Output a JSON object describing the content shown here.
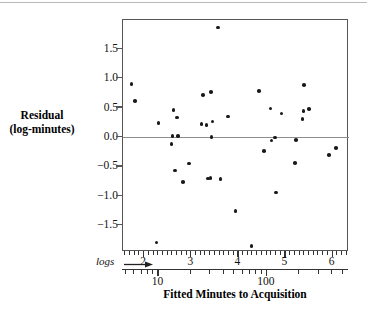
{
  "chart_data": {
    "type": "scatter",
    "title": "",
    "xlabel": "Fitted Minutes to Acquisition",
    "ylabel": "Residual (log-minutes)",
    "ylabel_line1": "Residual",
    "ylabel_line2": "(log-minutes)",
    "xlabel_secondary": "logs",
    "x_scale": "log",
    "x_is_log_of_minutes": true,
    "xlim": [
      1.55,
      6.35
    ],
    "ylim": [
      -1.95,
      2.0
    ],
    "grid": false,
    "legend": null,
    "zero_reference_line": 0.0,
    "y_ticks": [
      {
        "value": 1.5,
        "label": "1.5"
      },
      {
        "value": 1.0,
        "label": "1.0"
      },
      {
        "value": 0.5,
        "label": "0.5"
      },
      {
        "value": 0.0,
        "label": "0.0"
      },
      {
        "value": -0.5,
        "label": "−0.5"
      },
      {
        "value": -1.0,
        "label": "−1.0"
      },
      {
        "value": -1.5,
        "label": "−1.5"
      }
    ],
    "x_ticks_log": [
      {
        "value": 2,
        "label": "2"
      },
      {
        "value": 3,
        "label": "3"
      },
      {
        "value": 4,
        "label": "4"
      },
      {
        "value": 5,
        "label": "5"
      },
      {
        "value": 6,
        "label": "6"
      }
    ],
    "x_ticks_minutes": [
      {
        "value": 10,
        "label": "10"
      },
      {
        "value": 100,
        "label": "100"
      }
    ],
    "points": [
      {
        "x": 1.73,
        "y": 0.91
      },
      {
        "x": 1.8,
        "y": 0.62
      },
      {
        "x": 2.3,
        "y": 0.25
      },
      {
        "x": 2.26,
        "y": -1.79
      },
      {
        "x": 2.62,
        "y": 0.47
      },
      {
        "x": 2.6,
        "y": 0.02
      },
      {
        "x": 2.58,
        "y": -0.11
      },
      {
        "x": 2.7,
        "y": 0.34
      },
      {
        "x": 2.72,
        "y": 0.03
      },
      {
        "x": 2.66,
        "y": -0.56
      },
      {
        "x": 2.82,
        "y": -0.76
      },
      {
        "x": 2.95,
        "y": -0.44
      },
      {
        "x": 3.25,
        "y": 0.72
      },
      {
        "x": 3.22,
        "y": 0.23
      },
      {
        "x": 3.32,
        "y": 0.21
      },
      {
        "x": 3.42,
        "y": 0.77
      },
      {
        "x": 3.45,
        "y": 0.27
      },
      {
        "x": 3.43,
        "y": 0.01
      },
      {
        "x": 3.35,
        "y": -0.7
      },
      {
        "x": 3.41,
        "y": -0.69
      },
      {
        "x": 3.57,
        "y": 1.87
      },
      {
        "x": 3.62,
        "y": -0.71
      },
      {
        "x": 3.78,
        "y": 0.36
      },
      {
        "x": 3.94,
        "y": -1.25
      },
      {
        "x": 4.28,
        "y": -1.85
      },
      {
        "x": 4.44,
        "y": 0.79
      },
      {
        "x": 4.55,
        "y": -0.23
      },
      {
        "x": 4.68,
        "y": 0.49
      },
      {
        "x": 4.7,
        "y": -0.05
      },
      {
        "x": 4.78,
        "y": 0.0
      },
      {
        "x": 4.8,
        "y": -0.94
      },
      {
        "x": 4.92,
        "y": 0.41
      },
      {
        "x": 5.22,
        "y": -0.04
      },
      {
        "x": 5.2,
        "y": -0.43
      },
      {
        "x": 5.4,
        "y": 0.89
      },
      {
        "x": 5.38,
        "y": 0.45
      },
      {
        "x": 5.36,
        "y": 0.31
      },
      {
        "x": 5.5,
        "y": 0.48
      },
      {
        "x": 5.92,
        "y": -0.3
      },
      {
        "x": 6.08,
        "y": -0.18
      }
    ],
    "point_count": 40
  }
}
